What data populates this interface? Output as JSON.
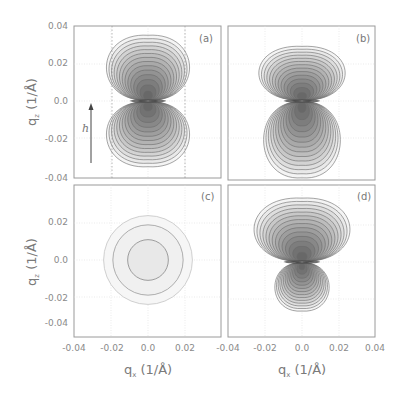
{
  "chart_data": {
    "type": "heatmap",
    "title": "",
    "xlabel": "q_x (1/Å)",
    "ylabel": "q_z (1/Å)",
    "xlim": [
      -0.04,
      0.04
    ],
    "ylim": [
      -0.04,
      0.04
    ],
    "annotations": [
      {
        "panel": "a",
        "text": "h",
        "type": "arrow",
        "direction": "up"
      }
    ],
    "panels": [
      {
        "label": "(a)",
        "shape": "symmetric two-lobe (dipole)",
        "upper_lobe": {
          "half_width": 0.026,
          "height": 0.035
        },
        "lower_lobe": {
          "half_width": 0.026,
          "height": 0.035
        },
        "contours": 14
      },
      {
        "label": "(b)",
        "shape": "two-lobe, lower lobe taller",
        "upper_lobe": {
          "half_width": 0.027,
          "height": 0.029
        },
        "lower_lobe": {
          "half_width": 0.024,
          "height": 0.041
        },
        "contours": 14
      },
      {
        "label": "(c)",
        "shape": "concentric circles",
        "radii": [
          0.011,
          0.019,
          0.024
        ],
        "contours": 3
      },
      {
        "label": "(d)",
        "shape": "two-lobe, upper lobe wide, lower lobe small",
        "upper_lobe": {
          "half_width": 0.03,
          "height": 0.034
        },
        "lower_lobe": {
          "half_width": 0.017,
          "height": 0.026
        },
        "contours": 14
      }
    ]
  },
  "figure": {
    "y_ticks_top": [
      "0.04",
      "0.02",
      "0.0",
      "-0.02",
      "-0.04"
    ],
    "y_ticks_bottom": [
      "0.02",
      "0.0",
      "-0.02",
      "-0.04"
    ],
    "x_ticks_left": [
      "-0.04",
      "-0.02",
      "0.0",
      "0.02"
    ],
    "x_ticks_right": [
      "-0.04",
      "-0.02",
      "0.0",
      "0.02",
      "0.04"
    ],
    "ylabel_top": "q",
    "ylabel_bottom": "q",
    "ylabel_sub": "z",
    "xlabel_left": "q",
    "xlabel_right": "q",
    "xlabel_sub": "x",
    "unit": " (1/Å)",
    "panel_labels": [
      "(a)",
      "(b)",
      "(c)",
      "(d)"
    ],
    "arrow_label": "h"
  }
}
